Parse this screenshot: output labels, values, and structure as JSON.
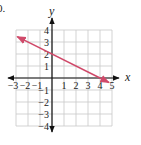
{
  "problem_label": "0.",
  "chart_data": {
    "type": "line",
    "title": "",
    "xlabel": "x",
    "ylabel": "y",
    "xlim": [
      -3,
      5
    ],
    "ylim": [
      -4,
      4
    ],
    "grid": true,
    "x_ticks": [
      -3,
      -2,
      -1,
      1,
      2,
      3,
      4,
      5
    ],
    "y_ticks": [
      4,
      3,
      2,
      1,
      -1,
      -2,
      -3,
      -4
    ],
    "series": [
      {
        "name": "line",
        "equation": "y = -0.5x + 2",
        "x": [
          -2.9,
          0,
          4,
          4.75
        ],
        "y": [
          3.45,
          2,
          0,
          -0.375
        ],
        "color": "#d04a6a",
        "arrows": "both"
      }
    ],
    "legend": null
  },
  "colors": {
    "grid": "#c8c8c8",
    "axis": "#111111",
    "line": "#d04a6a"
  }
}
